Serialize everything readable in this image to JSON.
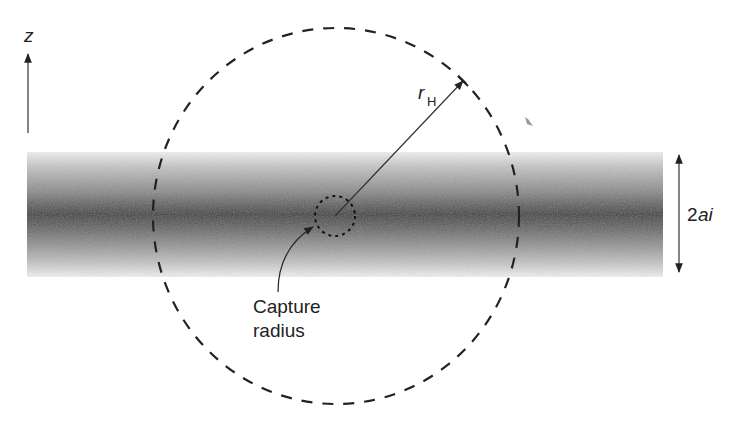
{
  "diagram": {
    "axis_label": "z",
    "radius_label": "r",
    "radius_subscript": "H",
    "width_label_num": "2",
    "width_label_var": "ai",
    "capture_label_line1": "Capture",
    "capture_label_line2": "radius"
  },
  "colors": {
    "background": "#ffffff",
    "ink": "#222222",
    "band_dark": "#3a3a3a",
    "band_light": "#f2f2f2"
  }
}
